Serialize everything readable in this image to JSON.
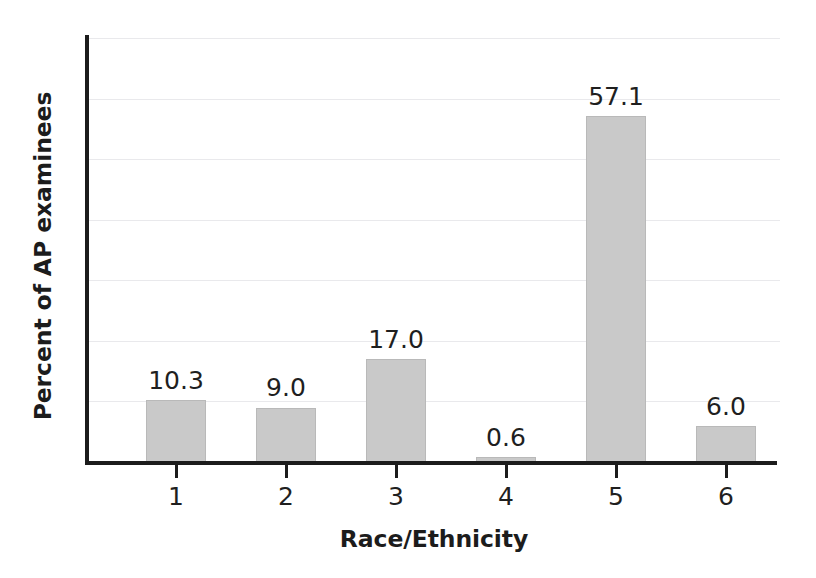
{
  "chart_data": {
    "type": "bar",
    "title": "",
    "xlabel": "Race/Ethnicity",
    "ylabel": "Percent of AP examinees",
    "categories": [
      "1",
      "2",
      "3",
      "4",
      "5",
      "6"
    ],
    "values": [
      10.3,
      9.0,
      17.0,
      0.6,
      57.1,
      6.0
    ],
    "value_labels": [
      "10.3",
      "9.0",
      "17.0",
      "0.6",
      "57.1",
      "6.0"
    ],
    "ylim": [
      0,
      70
    ],
    "y_tick_labels": [],
    "gridlines": [
      0,
      10,
      20,
      30,
      40,
      50,
      60,
      70
    ],
    "grid": true,
    "legend": false,
    "bar_color": "#c9c9c9",
    "bar_edge_color": "#b9b9b9",
    "axis_color": "#1c1c1c",
    "gridline_color": "#e9e9ec",
    "background_color": "#ffffff"
  }
}
